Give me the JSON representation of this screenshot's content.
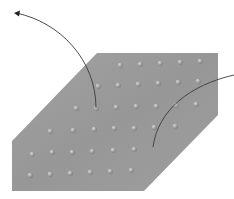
{
  "diagram": {
    "colors": {
      "background": "#ffffff",
      "surface": "#9b9b9b",
      "surface_shade": "#8e8e8e",
      "bump_highlight": "#d2d2d2",
      "bump_base": "#a8a8a8",
      "bump_shadow": "#7c7c7c",
      "leader_line": "#3a3a3a"
    },
    "surface_polygon": [
      [
        97,
        53
      ],
      [
        218,
        53
      ],
      [
        218,
        115
      ],
      [
        144,
        191
      ],
      [
        12,
        191
      ],
      [
        12,
        141
      ]
    ],
    "bumps": [
      [
        120,
        65
      ],
      [
        140,
        64
      ],
      [
        160,
        63
      ],
      [
        180,
        62
      ],
      [
        200,
        61
      ],
      [
        98,
        86
      ],
      [
        118,
        85
      ],
      [
        138,
        84
      ],
      [
        158,
        83
      ],
      [
        178,
        82
      ],
      [
        198,
        81
      ],
      [
        76,
        108
      ],
      [
        96,
        108
      ],
      [
        116,
        107
      ],
      [
        136,
        106
      ],
      [
        156,
        106
      ],
      [
        176,
        105
      ],
      [
        196,
        104
      ],
      [
        50,
        131
      ],
      [
        73,
        130
      ],
      [
        94,
        129
      ],
      [
        114,
        128
      ],
      [
        134,
        128
      ],
      [
        154,
        127
      ],
      [
        175,
        126
      ],
      [
        32,
        154
      ],
      [
        52,
        152
      ],
      [
        72,
        152
      ],
      [
        92,
        151
      ],
      [
        113,
        150
      ],
      [
        134,
        149
      ],
      [
        30,
        175
      ],
      [
        50,
        174
      ],
      [
        70,
        173
      ],
      [
        90,
        172
      ],
      [
        110,
        171
      ],
      [
        131,
        170
      ]
    ],
    "leaders": [
      {
        "name": "leader-top-left",
        "path": "M96,108 C 96,60 60,22 16,13",
        "arrow": true,
        "arrow_tip": [
          14,
          13
        ]
      },
      {
        "name": "leader-right",
        "path": "M153,147 C 158,110 190,85 234,75",
        "arrow": false
      }
    ]
  }
}
